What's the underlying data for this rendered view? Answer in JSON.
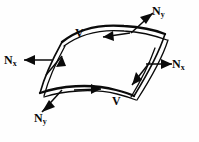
{
  "figure": {
    "kind": "shell-element-force-diagram",
    "background_color": "#fefefe",
    "line_color": "#0a0a0a"
  },
  "labels": {
    "ny_top": {
      "symbol": "N",
      "subscript": "y",
      "text": "Ny"
    },
    "ny_bottom": {
      "symbol": "N",
      "subscript": "y",
      "text": "Ny"
    },
    "nx_left": {
      "symbol": "N",
      "subscript": "x",
      "text": "Nx"
    },
    "nx_right": {
      "symbol": "N",
      "subscript": "x",
      "text": "Nx"
    },
    "v_top": {
      "text": "V"
    },
    "v_bottom": {
      "text": "V"
    }
  },
  "force_vectors": [
    {
      "name": "ny-top",
      "label": "Ny",
      "direction": "up-right",
      "position": "top-right-edge"
    },
    {
      "name": "nx-left",
      "label": "Nx",
      "direction": "left",
      "position": "left-edge"
    },
    {
      "name": "nx-right",
      "label": "Nx",
      "direction": "right",
      "position": "right-edge"
    },
    {
      "name": "ny-bottom",
      "label": "Ny",
      "direction": "down-left",
      "position": "bottom-left-edge"
    }
  ],
  "shear_flows": [
    {
      "name": "v-top",
      "label": "V",
      "direction": "left",
      "position": "far-top-edge"
    },
    {
      "name": "v-left",
      "label": "V",
      "direction": "up-right",
      "position": "left-edge"
    },
    {
      "name": "v-bottom",
      "label": "V",
      "direction": "right",
      "position": "near-bottom-edge"
    },
    {
      "name": "v-right",
      "label": "V",
      "direction": "down-left",
      "position": "right-edge"
    }
  ]
}
